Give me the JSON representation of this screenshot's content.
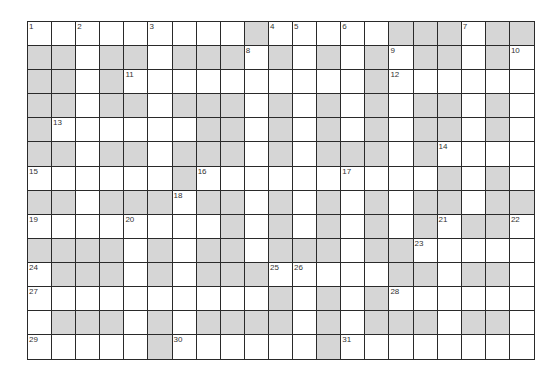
{
  "puzzle": {
    "rows": 14,
    "cols": 21,
    "colors": {
      "block": "#d6d6d6",
      "open": "#ffffff",
      "line": "#2a2a2a"
    },
    "layout": [
      "000000000100000111011",
      "110110111010101011010",
      "110100000000001000000",
      "110110111010101011010",
      "100000011010101011010",
      "110110111010111010000",
      "000000100000000001010",
      "110111011010101011011",
      "000000001010101010110",
      "111101011011101100000",
      "011101011100000110110",
      "000000000010101000000",
      "011101011110101110110",
      "000001000000100000000"
    ],
    "numbers": [
      {
        "n": "1",
        "r": 0,
        "c": 0
      },
      {
        "n": "2",
        "r": 0,
        "c": 2
      },
      {
        "n": "3",
        "r": 0,
        "c": 5
      },
      {
        "n": "4",
        "r": 0,
        "c": 10
      },
      {
        "n": "5",
        "r": 0,
        "c": 11
      },
      {
        "n": "6",
        "r": 0,
        "c": 13
      },
      {
        "n": "7",
        "r": 0,
        "c": 18
      },
      {
        "n": "8",
        "r": 1,
        "c": 9
      },
      {
        "n": "9",
        "r": 1,
        "c": 15
      },
      {
        "n": "10",
        "r": 1,
        "c": 20
      },
      {
        "n": "11",
        "r": 2,
        "c": 4
      },
      {
        "n": "12",
        "r": 2,
        "c": 15
      },
      {
        "n": "13",
        "r": 4,
        "c": 1
      },
      {
        "n": "14",
        "r": 5,
        "c": 17
      },
      {
        "n": "15",
        "r": 6,
        "c": 0
      },
      {
        "n": "16",
        "r": 6,
        "c": 7
      },
      {
        "n": "17",
        "r": 6,
        "c": 13
      },
      {
        "n": "18",
        "r": 7,
        "c": 6
      },
      {
        "n": "19",
        "r": 8,
        "c": 0
      },
      {
        "n": "20",
        "r": 8,
        "c": 4
      },
      {
        "n": "21",
        "r": 8,
        "c": 17
      },
      {
        "n": "22",
        "r": 8,
        "c": 20
      },
      {
        "n": "23",
        "r": 9,
        "c": 16
      },
      {
        "n": "24",
        "r": 10,
        "c": 0
      },
      {
        "n": "25",
        "r": 10,
        "c": 10
      },
      {
        "n": "26",
        "r": 10,
        "c": 11
      },
      {
        "n": "27",
        "r": 11,
        "c": 0
      },
      {
        "n": "28",
        "r": 11,
        "c": 15
      },
      {
        "n": "29",
        "r": 13,
        "c": 0
      },
      {
        "n": "30",
        "r": 13,
        "c": 6
      },
      {
        "n": "31",
        "r": 13,
        "c": 13
      }
    ]
  }
}
